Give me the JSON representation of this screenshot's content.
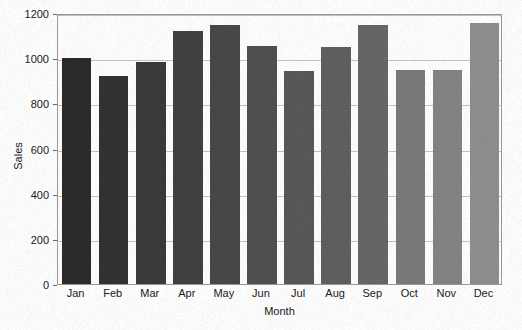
{
  "chart_data": {
    "type": "bar",
    "title": "",
    "xlabel": "Month",
    "ylabel": "Sales",
    "categories": [
      "Jan",
      "Feb",
      "Mar",
      "Apr",
      "May",
      "Jun",
      "Jul",
      "Aug",
      "Sep",
      "Oct",
      "Nov",
      "Dec"
    ],
    "values": [
      1000,
      920,
      985,
      1120,
      1145,
      1055,
      945,
      1050,
      1145,
      950,
      950,
      1155
    ],
    "bar_colors": [
      "#2b2b2b",
      "#323232",
      "#3a3a3a",
      "#414141",
      "#484848",
      "#505050",
      "#585858",
      "#5f5f5f",
      "#676767",
      "#7a7a7a",
      "#848484",
      "#8f8f8f"
    ],
    "ylim": [
      0,
      1200
    ],
    "yticks": [
      0,
      200,
      400,
      600,
      800,
      1000,
      1200
    ],
    "ytick_labels": [
      "0",
      "200",
      "400",
      "600",
      "800",
      "1000",
      "1200"
    ],
    "grid": "horizontal",
    "legend": "none"
  },
  "axes": {
    "y_title": "Sales",
    "x_title": "Month"
  }
}
